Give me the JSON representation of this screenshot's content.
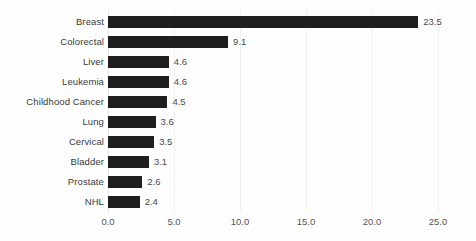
{
  "chart_data": {
    "type": "bar",
    "orientation": "horizontal",
    "title": "",
    "subtitle": "",
    "xlabel": "",
    "ylabel": "",
    "xlim": [
      0.0,
      25.0
    ],
    "xticks": [
      "0.0",
      "5.0",
      "10.0",
      "15.0",
      "20.0",
      "25.0"
    ],
    "xtick_values": [
      0.0,
      5.0,
      10.0,
      15.0,
      20.0,
      25.0
    ],
    "grid": true,
    "legend": false,
    "bar_color": "#1f1f1f",
    "gridline_color": "#f1f1f1",
    "categories": [
      "Breast",
      "Colorectal",
      "Liver",
      "Leukemia",
      "Childhood Cancer",
      "Lung",
      "Cervical",
      "Bladder",
      "Prostate",
      "NHL"
    ],
    "values": [
      23.5,
      9.1,
      4.6,
      4.6,
      4.5,
      3.6,
      3.5,
      3.1,
      2.6,
      2.4
    ],
    "value_labels": [
      "23.5",
      "9.1",
      "4.6",
      "4.6",
      "4.5",
      "3.6",
      "3.5",
      "3.1",
      "2.6",
      "2.4"
    ],
    "bars": [
      {
        "category": "Breast",
        "value": 23.5,
        "label": "23.5"
      },
      {
        "category": "Colorectal",
        "value": 9.1,
        "label": "9.1"
      },
      {
        "category": "Liver",
        "value": 4.6,
        "label": "4.6"
      },
      {
        "category": "Leukemia",
        "value": 4.6,
        "label": "4.6"
      },
      {
        "category": "Childhood Cancer",
        "value": 4.5,
        "label": "4.5"
      },
      {
        "category": "Lung",
        "value": 3.6,
        "label": "3.6"
      },
      {
        "category": "Cervical",
        "value": 3.5,
        "label": "3.5"
      },
      {
        "category": "Bladder",
        "value": 3.1,
        "label": "3.1"
      },
      {
        "category": "Prostate",
        "value": 2.6,
        "label": "2.6"
      },
      {
        "category": "NHL",
        "value": 2.4,
        "label": "2.4"
      }
    ]
  }
}
